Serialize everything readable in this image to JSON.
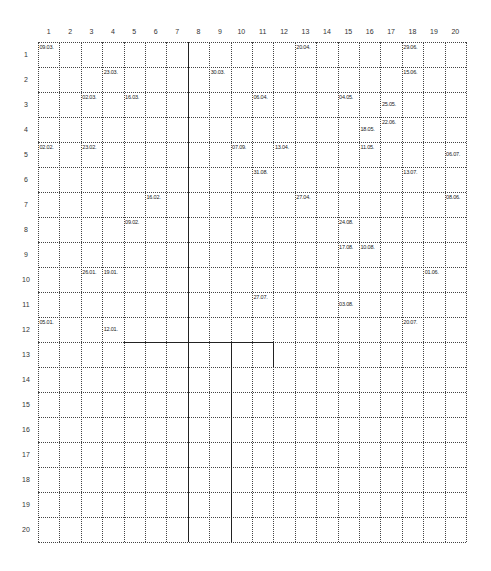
{
  "grid": {
    "columns": 20,
    "rows": 20,
    "origin_x": 38,
    "origin_y": 42,
    "cell_width": 21.4,
    "cell_height": 25,
    "line_color": "#444444",
    "column_labels": [
      "1",
      "2",
      "3",
      "4",
      "5",
      "6",
      "7",
      "8",
      "9",
      "10",
      "11",
      "12",
      "13",
      "14",
      "15",
      "16",
      "17",
      "18",
      "19",
      "20"
    ],
    "row_labels": [
      "1",
      "2",
      "3",
      "4",
      "5",
      "6",
      "7",
      "8",
      "9",
      "10",
      "11",
      "12",
      "13",
      "14",
      "15",
      "16",
      "17",
      "18",
      "19",
      "20"
    ]
  },
  "solid_lines": {
    "vertical_full": [
      7
    ],
    "vertical_partial": [
      {
        "after_col": 9,
        "from_row": 13,
        "to_row": 20
      },
      {
        "after_col": 11,
        "from_row": 13,
        "to_row": 13
      }
    ],
    "horizontal_partial": [
      {
        "above_row": 13,
        "from_col": 5,
        "to_col": 11
      }
    ]
  },
  "entries": [
    {
      "col": 1,
      "row": 1,
      "text": "09.03.",
      "pos": "top"
    },
    {
      "col": 13,
      "row": 1,
      "text": "20.04.",
      "pos": "top"
    },
    {
      "col": 18,
      "row": 1,
      "text": "29.06.",
      "pos": "top"
    },
    {
      "col": 4,
      "row": 2,
      "text": "23.03.",
      "pos": "top"
    },
    {
      "col": 9,
      "row": 2,
      "text": "30.03.",
      "pos": "top"
    },
    {
      "col": 18,
      "row": 2,
      "text": "15.06.",
      "pos": "top"
    },
    {
      "col": 3,
      "row": 3,
      "text": "02.03.",
      "pos": "top"
    },
    {
      "col": 5,
      "row": 3,
      "text": "16.03.",
      "pos": "top"
    },
    {
      "col": 11,
      "row": 3,
      "text": "06.04.",
      "pos": "top"
    },
    {
      "col": 15,
      "row": 3,
      "text": "04.05.",
      "pos": "top"
    },
    {
      "col": 17,
      "row": 3,
      "text": "25.05.",
      "pos": "low"
    },
    {
      "col": 17,
      "row": 4,
      "text": "22.06.",
      "pos": "top"
    },
    {
      "col": 16,
      "row": 4,
      "text": "18.05.",
      "pos": "low"
    },
    {
      "col": 1,
      "row": 5,
      "text": "02.02.",
      "pos": "top"
    },
    {
      "col": 3,
      "row": 5,
      "text": "23.02.",
      "pos": "top"
    },
    {
      "col": 10,
      "row": 5,
      "text": "07.09.",
      "pos": "top"
    },
    {
      "col": 12,
      "row": 5,
      "text": "13.04.",
      "pos": "top"
    },
    {
      "col": 16,
      "row": 5,
      "text": "11.05.",
      "pos": "top"
    },
    {
      "col": 20,
      "row": 5,
      "text": "06.07.",
      "pos": "low"
    },
    {
      "col": 11,
      "row": 6,
      "text": "31.08.",
      "pos": "top"
    },
    {
      "col": 18,
      "row": 6,
      "text": "13.07.",
      "pos": "top"
    },
    {
      "col": 6,
      "row": 7,
      "text": "16.02.",
      "pos": "top"
    },
    {
      "col": 13,
      "row": 7,
      "text": "27.04.",
      "pos": "top"
    },
    {
      "col": 20,
      "row": 7,
      "text": "08.06.",
      "pos": "top"
    },
    {
      "col": 5,
      "row": 8,
      "text": "09.02.",
      "pos": "top"
    },
    {
      "col": 15,
      "row": 8,
      "text": "24.08.",
      "pos": "top"
    },
    {
      "col": 15,
      "row": 9,
      "text": "17.08.",
      "pos": "top"
    },
    {
      "col": 16,
      "row": 9,
      "text": "10.08.",
      "pos": "top"
    },
    {
      "col": 3,
      "row": 10,
      "text": "26.01.",
      "pos": "top"
    },
    {
      "col": 4,
      "row": 10,
      "text": "19.01.",
      "pos": "top"
    },
    {
      "col": 19,
      "row": 10,
      "text": "01.06.",
      "pos": "top"
    },
    {
      "col": 11,
      "row": 11,
      "text": "27.07.",
      "pos": "top"
    },
    {
      "col": 15,
      "row": 11,
      "text": "03.08.",
      "pos": "low"
    },
    {
      "col": 1,
      "row": 12,
      "text": "05.01.",
      "pos": "top"
    },
    {
      "col": 4,
      "row": 12,
      "text": "12.01.",
      "pos": "low"
    },
    {
      "col": 18,
      "row": 12,
      "text": "20.07.",
      "pos": "top"
    }
  ]
}
